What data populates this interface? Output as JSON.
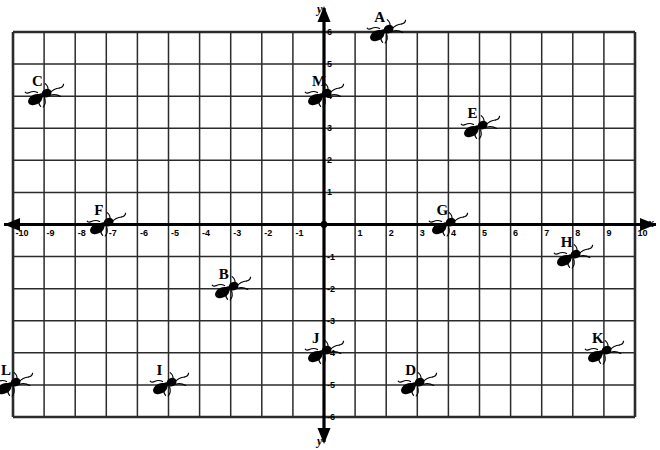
{
  "chart_data": {
    "type": "scatter",
    "title": "",
    "xlabel": "x",
    "ylabel": "y",
    "xlim": [
      -10,
      10
    ],
    "ylim": [
      -6,
      6
    ],
    "grid": true,
    "legend": "none",
    "x_ticks": [
      "-10",
      "-9",
      "-8",
      "-7",
      "-6",
      "-5",
      "-4",
      "-3",
      "-2",
      "-1",
      "1",
      "2",
      "3",
      "4",
      "5",
      "6",
      "7",
      "8",
      "9",
      "10"
    ],
    "y_ticks": [
      "6",
      "5",
      "4",
      "3",
      "2",
      "1",
      "-1",
      "-2",
      "-3",
      "-4",
      "-5",
      "-6"
    ],
    "point_marker": "ant",
    "points": [
      {
        "label": "A",
        "x": 2,
        "y": 6
      },
      {
        "label": "B",
        "x": -3,
        "y": -2
      },
      {
        "label": "C",
        "x": -9,
        "y": 4
      },
      {
        "label": "D",
        "x": 3,
        "y": -5
      },
      {
        "label": "E",
        "x": 5,
        "y": 3
      },
      {
        "label": "F",
        "x": -7,
        "y": 0
      },
      {
        "label": "G",
        "x": 4,
        "y": 0
      },
      {
        "label": "H",
        "x": 8,
        "y": -1
      },
      {
        "label": "I",
        "x": -5,
        "y": -5
      },
      {
        "label": "J",
        "x": 0,
        "y": -4
      },
      {
        "label": "K",
        "x": 9,
        "y": -4
      },
      {
        "label": "L",
        "x": -10,
        "y": -5
      },
      {
        "label": "M",
        "x": 0,
        "y": 4
      }
    ]
  },
  "style": {
    "ink": "#000000",
    "paper": "#ffffff",
    "gridline": "#2b2b2b"
  }
}
